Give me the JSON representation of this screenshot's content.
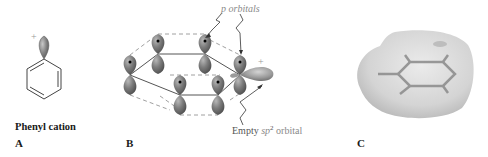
{
  "figure": {
    "panels": [
      {
        "id": "A",
        "label": "A",
        "caption": "Phenyl cation",
        "charge": "+",
        "structure": "benzene ring with empty orbital lobe at top carbon"
      },
      {
        "id": "B",
        "label": "B",
        "charge": "+",
        "annotations": {
          "p_orbitals": "p orbitals",
          "empty_prefix": "Empty ",
          "empty_hybrid": "sp",
          "empty_superscript": "2",
          "empty_suffix": " orbital"
        }
      },
      {
        "id": "C",
        "label": "C",
        "structure": "electrostatic potential map surface over phenyl cation"
      }
    ],
    "colors": {
      "orbital_fill": "#7a7a7a",
      "orbital_highlight": "#b5b5b5",
      "surface": "#d9d9d9",
      "annotation_gray": "#8a8a8a",
      "text": "#1a1a1a"
    }
  }
}
